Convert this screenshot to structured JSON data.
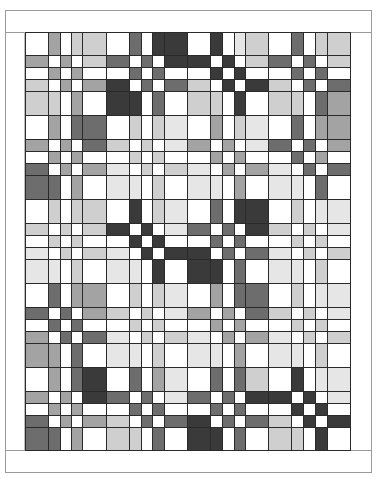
{
  "palette": {
    "0": "#ffffff",
    "1": "#e6e6e6",
    "2": "#cfcfcf",
    "3": "#a3a3a3",
    "4": "#6d6d6d",
    "5": "#3a3a3a"
  },
  "grid": {
    "col_edges": [
      25,
      48,
      60,
      71,
      82,
      106,
      129,
      141,
      152,
      164,
      187,
      210,
      222,
      234,
      245,
      268,
      291,
      303,
      315,
      327,
      350
    ],
    "row_edges": [
      32,
      55,
      67,
      79,
      91,
      115,
      139,
      151,
      163,
      175,
      199,
      223,
      235,
      247,
      259,
      283,
      307,
      319,
      331,
      343,
      367,
      391,
      403,
      415,
      427,
      450
    ],
    "shades": [
      [
        0,
        3,
        0,
        2,
        2,
        0,
        4,
        0,
        5,
        5,
        0,
        5,
        0,
        1,
        2,
        0,
        4,
        0,
        2,
        2
      ],
      [
        3,
        0,
        3,
        0,
        2,
        4,
        0,
        4,
        0,
        5,
        5,
        0,
        5,
        0,
        2,
        4,
        0,
        4,
        0,
        2
      ],
      [
        0,
        3,
        0,
        3,
        0,
        0,
        4,
        0,
        4,
        0,
        0,
        5,
        0,
        5,
        0,
        0,
        4,
        0,
        4,
        0
      ],
      [
        2,
        0,
        3,
        0,
        3,
        5,
        0,
        4,
        0,
        4,
        2,
        0,
        5,
        0,
        5,
        2,
        0,
        4,
        0,
        4
      ],
      [
        2,
        2,
        0,
        3,
        0,
        5,
        5,
        0,
        4,
        0,
        2,
        2,
        0,
        5,
        0,
        2,
        2,
        0,
        4,
        3
      ],
      [
        0,
        3,
        0,
        4,
        4,
        0,
        2,
        0,
        2,
        1,
        0,
        3,
        0,
        2,
        1,
        0,
        4,
        0,
        3,
        3
      ],
      [
        3,
        0,
        3,
        0,
        4,
        2,
        0,
        2,
        0,
        1,
        3,
        0,
        3,
        0,
        1,
        4,
        0,
        4,
        0,
        3
      ],
      [
        0,
        3,
        0,
        3,
        0,
        0,
        2,
        0,
        2,
        0,
        0,
        3,
        0,
        3,
        0,
        0,
        4,
        0,
        3,
        0
      ],
      [
        4,
        0,
        3,
        0,
        3,
        1,
        0,
        2,
        0,
        2,
        1,
        0,
        3,
        0,
        3,
        1,
        0,
        4,
        0,
        4
      ],
      [
        4,
        4,
        0,
        3,
        0,
        1,
        1,
        0,
        2,
        0,
        1,
        1,
        0,
        3,
        0,
        1,
        1,
        0,
        4,
        0
      ],
      [
        0,
        2,
        0,
        2,
        2,
        0,
        5,
        0,
        2,
        1,
        0,
        4,
        0,
        5,
        5,
        0,
        2,
        0,
        1,
        1
      ],
      [
        2,
        0,
        2,
        0,
        2,
        5,
        0,
        5,
        0,
        1,
        4,
        0,
        4,
        0,
        5,
        2,
        0,
        2,
        0,
        1
      ],
      [
        0,
        2,
        0,
        2,
        0,
        0,
        5,
        0,
        5,
        0,
        0,
        4,
        0,
        4,
        0,
        0,
        2,
        0,
        2,
        0
      ],
      [
        1,
        0,
        2,
        0,
        2,
        1,
        0,
        5,
        0,
        5,
        5,
        0,
        4,
        0,
        4,
        1,
        0,
        2,
        0,
        2
      ],
      [
        1,
        1,
        0,
        2,
        0,
        1,
        1,
        0,
        5,
        0,
        5,
        5,
        0,
        4,
        0,
        1,
        1,
        0,
        2,
        0
      ],
      [
        0,
        4,
        0,
        3,
        3,
        0,
        2,
        0,
        2,
        1,
        0,
        3,
        0,
        4,
        4,
        0,
        2,
        0,
        1,
        1
      ],
      [
        4,
        0,
        4,
        0,
        3,
        2,
        0,
        2,
        0,
        1,
        3,
        0,
        3,
        0,
        4,
        2,
        0,
        2,
        0,
        1
      ],
      [
        0,
        4,
        0,
        4,
        0,
        0,
        2,
        0,
        2,
        0,
        0,
        3,
        0,
        3,
        0,
        0,
        2,
        0,
        2,
        0
      ],
      [
        3,
        0,
        4,
        0,
        4,
        1,
        0,
        2,
        0,
        2,
        1,
        0,
        3,
        0,
        3,
        1,
        0,
        2,
        0,
        2
      ],
      [
        3,
        3,
        0,
        4,
        0,
        1,
        1,
        0,
        2,
        0,
        1,
        1,
        0,
        3,
        0,
        1,
        1,
        0,
        2,
        0
      ],
      [
        0,
        3,
        0,
        4,
        5,
        0,
        4,
        0,
        3,
        1,
        0,
        4,
        0,
        4,
        2,
        0,
        5,
        0,
        1,
        1
      ],
      [
        3,
        0,
        3,
        0,
        5,
        4,
        0,
        4,
        0,
        1,
        4,
        0,
        4,
        0,
        5,
        5,
        0,
        5,
        0,
        1
      ],
      [
        0,
        3,
        0,
        3,
        0,
        0,
        4,
        0,
        4,
        0,
        0,
        4,
        0,
        4,
        0,
        0,
        5,
        0,
        5,
        0
      ],
      [
        4,
        0,
        3,
        0,
        3,
        2,
        0,
        4,
        0,
        4,
        5,
        0,
        4,
        0,
        4,
        2,
        0,
        5,
        0,
        5
      ],
      [
        4,
        4,
        0,
        3,
        0,
        2,
        2,
        0,
        4,
        0,
        5,
        5,
        0,
        4,
        0,
        2,
        2,
        0,
        5,
        0
      ]
    ]
  }
}
